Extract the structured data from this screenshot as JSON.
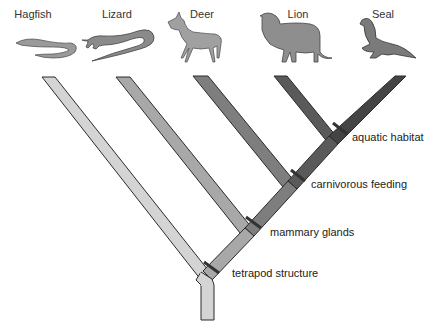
{
  "taxa": [
    {
      "name": "Hagfish",
      "x": 33,
      "y": 8,
      "color": "#d4d4d4"
    },
    {
      "name": "Lizard",
      "x": 117,
      "y": 8,
      "color": "#a8a8a8"
    },
    {
      "name": "Deer",
      "x": 202,
      "y": 8,
      "color": "#7e7e7e"
    },
    {
      "name": "Lion",
      "x": 298,
      "y": 8,
      "color": "#5a5a5a"
    },
    {
      "name": "Seal",
      "x": 383,
      "y": 8,
      "color": "#444444"
    }
  ],
  "characters": [
    {
      "label": "tetrapod structure",
      "x": 232,
      "y": 267
    },
    {
      "label": "mammary glands",
      "x": 270,
      "y": 226
    },
    {
      "label": "carnivorous feeding",
      "x": 311,
      "y": 178
    },
    {
      "label": "aquatic habitat",
      "x": 352,
      "y": 131
    }
  ],
  "colors": {
    "outline": "#2a2a2a",
    "trunk": "#d4d4d4",
    "hagfish": "#d4d4d4",
    "lizard": "#a8a8a8",
    "deer": "#7e7e7e",
    "lion": "#5a5a5a",
    "seal": "#444444",
    "marker": "#333333"
  }
}
